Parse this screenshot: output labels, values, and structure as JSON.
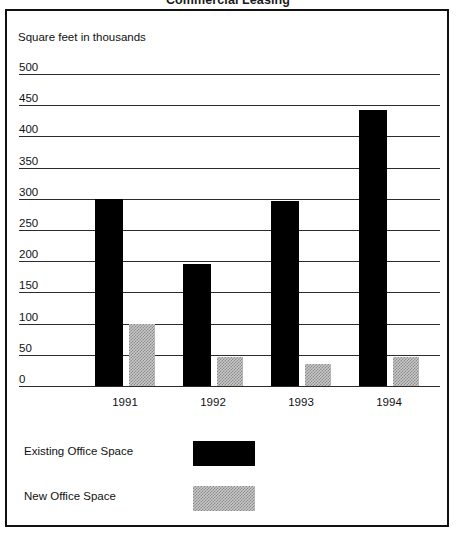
{
  "chart_data": {
    "type": "bar",
    "title": "Commercial Leasing",
    "ylabel": "Square feet in thousands",
    "xlabel": "",
    "categories": [
      "1991",
      "1992",
      "1993",
      "1994"
    ],
    "series": [
      {
        "name": "Existing Office Space",
        "values": [
          300,
          195,
          297,
          443
        ],
        "color": "#000000",
        "pattern": "solid"
      },
      {
        "name": "New Office Space",
        "values": [
          100,
          47,
          35,
          47
        ],
        "color": "#c9c9c9",
        "pattern": "dotted-hatch"
      }
    ],
    "ylim": [
      0,
      500
    ],
    "ytick_step": 50,
    "yticks": [
      "500",
      "450",
      "400",
      "350",
      "300",
      "250",
      "200",
      "150",
      "100",
      "50",
      "0"
    ],
    "grid": true,
    "legend_position": "bottom-left",
    "legend": [
      "Existing Office Space",
      "New Office Space"
    ]
  },
  "figure": {
    "title": "Commercial Leasing",
    "axis_caption": "Square feet in thousands",
    "border_color": "#111111",
    "gridline_color": "#2b2b2b",
    "background": "#ffffff"
  }
}
